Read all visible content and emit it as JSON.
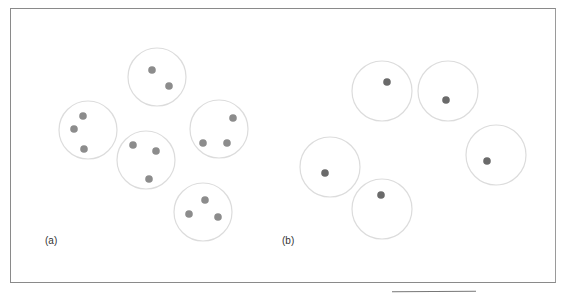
{
  "figure": {
    "panels": [
      {
        "label": "(a)",
        "label_pos": [
          45,
          242
        ],
        "dot_color": "#8c8c8c",
        "circle_color": "#dcdcdc",
        "clusters": [
          {
            "cx": 157,
            "cy": 77,
            "r": 29,
            "dots": [
              [
                152,
                70
              ],
              [
                169,
                86
              ]
            ]
          },
          {
            "cx": 88,
            "cy": 130,
            "r": 29,
            "dots": [
              [
                83,
                116
              ],
              [
                74,
                129
              ],
              [
                84,
                149
              ]
            ]
          },
          {
            "cx": 146,
            "cy": 160,
            "r": 29,
            "dots": [
              [
                133,
                145
              ],
              [
                156,
                151
              ],
              [
                149,
                179
              ]
            ]
          },
          {
            "cx": 219,
            "cy": 129,
            "r": 29,
            "dots": [
              [
                233,
                118
              ],
              [
                203,
                143
              ],
              [
                227,
                143
              ]
            ]
          },
          {
            "cx": 203,
            "cy": 212,
            "r": 29,
            "dots": [
              [
                205,
                200
              ],
              [
                189,
                214
              ],
              [
                218,
                217
              ]
            ]
          }
        ]
      },
      {
        "label": "(b)",
        "label_pos": [
          282,
          242
        ],
        "dot_color": "#6a6a6a",
        "circle_color": "#dcdcdc",
        "clusters": [
          {
            "cx": 382,
            "cy": 91,
            "r": 30,
            "dots": [
              [
                387,
                82
              ]
            ]
          },
          {
            "cx": 448,
            "cy": 91,
            "r": 30,
            "dots": [
              [
                446,
                100
              ]
            ]
          },
          {
            "cx": 330,
            "cy": 167,
            "r": 30,
            "dots": [
              [
                325,
                173
              ]
            ]
          },
          {
            "cx": 382,
            "cy": 209,
            "r": 30,
            "dots": [
              [
                381,
                195
              ]
            ]
          },
          {
            "cx": 496,
            "cy": 155,
            "r": 30,
            "dots": [
              [
                487,
                161
              ]
            ]
          }
        ]
      }
    ]
  }
}
